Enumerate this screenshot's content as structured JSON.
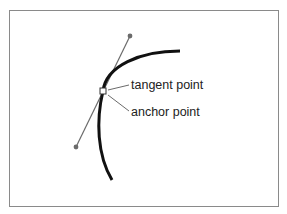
{
  "diagram": {
    "type": "bezier-curve-anchor-illustration",
    "labels": {
      "tangent_point": "tangent point",
      "anchor_point": "anchor point"
    },
    "colors": {
      "frame_border": "#8a8a8a",
      "curve": "#111111",
      "handle_line": "#6b6b6b",
      "handle_dot": "#6b6b6b",
      "leader_line": "#6b6b6b",
      "anchor_fill": "#ffffff",
      "anchor_stroke": "#333333",
      "text": "#222222"
    },
    "elements": {
      "curve": {
        "start": [
          180,
          51
        ],
        "end": [
          112,
          180
        ]
      },
      "tangent_handle": {
        "top_end": [
          130,
          36
        ],
        "bottom_end": [
          76,
          147
        ]
      },
      "anchor": [
        103,
        91
      ]
    }
  }
}
